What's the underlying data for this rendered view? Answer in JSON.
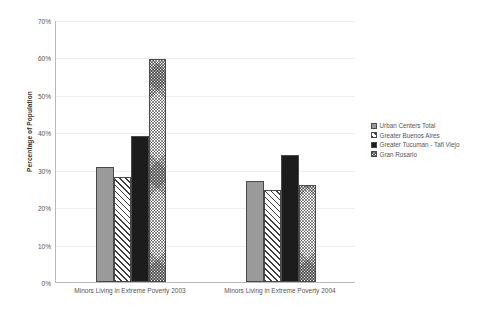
{
  "chart_data": {
    "type": "bar",
    "title": "",
    "xlabel": "",
    "ylabel": "Percentage of Population",
    "ylim": [
      0,
      70
    ],
    "ytick_labels": [
      "0%",
      "10%",
      "20%",
      "30%",
      "40%",
      "50%",
      "60%",
      "70%"
    ],
    "ytick_values": [
      0,
      10,
      20,
      30,
      40,
      50,
      60,
      70
    ],
    "grid": true,
    "legend_position": "right",
    "categories": [
      "Minors Living in Extreme Poverty 2003",
      "Minors Living in Extreme Poverty 2004"
    ],
    "series": [
      {
        "name": "Urban Centers Total",
        "pattern": "solid-gray",
        "values": [
          30.8,
          27.0
        ]
      },
      {
        "name": "Greater Buenos Aires",
        "pattern": "diagonal",
        "values": [
          28.0,
          24.5
        ]
      },
      {
        "name": "Greater Tucuman - Tafi Viejo",
        "pattern": "solid-black",
        "values": [
          39.0,
          34.0
        ]
      },
      {
        "name": "Gran Rosario",
        "pattern": "checker",
        "values": [
          59.5,
          26.0
        ]
      }
    ]
  }
}
